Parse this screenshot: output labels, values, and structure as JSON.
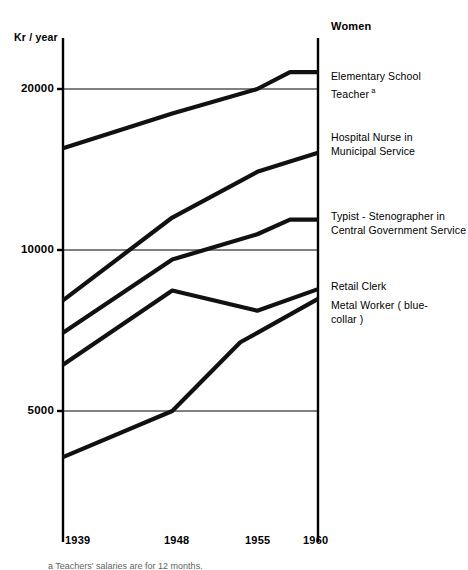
{
  "header": {
    "column_title": "Women",
    "y_axis_title": "Kr / year"
  },
  "footnote": "a Teachers' salaries are for 12 months.",
  "chart_data": {
    "type": "line",
    "title": "",
    "xlabel": "",
    "ylabel": "Kr / year",
    "scale": "logarithmic",
    "grid": true,
    "legend_position": "right-inline",
    "x": [
      1939,
      1948,
      1955,
      1960
    ],
    "xtick_labels": [
      "1939",
      "1948",
      "1955",
      "1960"
    ],
    "ytick_labels": [
      "20000",
      "10000",
      "5000"
    ],
    "ytick_values": [
      20000,
      10000,
      5000
    ],
    "ylim": [
      3600,
      24000
    ],
    "series": [
      {
        "name": "Elementary School Teacher",
        "label_line1": "Elementary School",
        "label_line2": "Teacher",
        "label_superscript": "a",
        "values": [
          15500,
          18000,
          20000,
          21500
        ],
        "label_y": 70
      },
      {
        "name": "Hospital Nurse in Municipal Service",
        "label_line1": "Hospital Nurse in",
        "label_line2": "Municipal Service",
        "label_superscript": "",
        "values": [
          8050,
          11500,
          14000,
          15200
        ],
        "label_y": 131
      },
      {
        "name": "Typist - Stenographer in Central Government Service",
        "label_line1": "Typist - Stenographer in",
        "label_line2": "Central Government Service",
        "label_superscript": "",
        "values": [
          7000,
          9600,
          10700,
          11400
        ],
        "label_y": 210
      },
      {
        "name": "Retail Clerk",
        "label_line1": "Retail Clerk",
        "label_line2": "",
        "label_superscript": "",
        "values": [
          6100,
          8400,
          7700,
          8450
        ],
        "label_y": 280
      },
      {
        "name": "Metal Worker (blue-collar)",
        "label_line1": "Metal Worker ( blue-",
        "label_line2": "collar )",
        "label_superscript": "",
        "values": [
          4100,
          5000,
          7000,
          8100
        ],
        "label_y": 299
      }
    ],
    "colors": {
      "line": "#111111",
      "axis": "#000000",
      "grid": "#000000",
      "background": "#ffffff"
    }
  }
}
